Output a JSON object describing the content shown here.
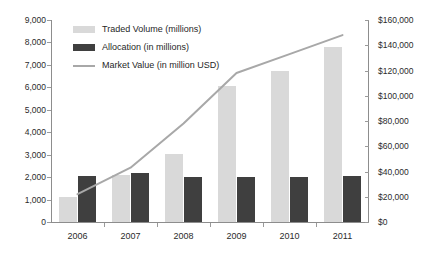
{
  "chart_data": {
    "type": "bar",
    "title": "",
    "xlabel": "",
    "ylabel": "",
    "categories": [
      "2006",
      "2007",
      "2008",
      "2009",
      "2010",
      "2011"
    ],
    "series": [
      {
        "name": "Traded Volume (millions)",
        "type": "bar",
        "axis": "left",
        "color": "#d9d9d9",
        "values": [
          1100,
          2100,
          3050,
          6050,
          6750,
          7800
        ]
      },
      {
        "name": "Allocation (in millions)",
        "type": "bar",
        "axis": "left",
        "color": "#3f3f3f",
        "values": [
          2050,
          2200,
          2000,
          2000,
          2000,
          2050
        ]
      },
      {
        "name": "Market Value (in million USD)",
        "type": "line",
        "axis": "right",
        "color": "#a8a8a8",
        "values": [
          22000,
          43000,
          78000,
          118000,
          133000,
          148000
        ]
      }
    ],
    "left_axis": {
      "ylim": [
        0,
        9000
      ],
      "ticks": [
        0,
        1000,
        2000,
        3000,
        4000,
        5000,
        6000,
        7000,
        8000,
        9000
      ],
      "tick_labels": [
        "0",
        "1,000",
        "2,000",
        "3,000",
        "4,000",
        "5,000",
        "6,000",
        "7,000",
        "8,000",
        "9,000"
      ]
    },
    "right_axis": {
      "ylim": [
        0,
        160000
      ],
      "ticks": [
        0,
        20000,
        40000,
        60000,
        80000,
        100000,
        120000,
        140000,
        160000
      ],
      "tick_labels": [
        "$0",
        "$20,000",
        "$40,000",
        "$60,000",
        "$80,000",
        "$100,000",
        "$120,000",
        "$140,000",
        "$160,000"
      ]
    },
    "grid": false,
    "legend_position": "top-left",
    "legend": [
      "Traded Volume (millions)",
      "Allocation (in millions)",
      "Market Value (in million USD)"
    ]
  }
}
